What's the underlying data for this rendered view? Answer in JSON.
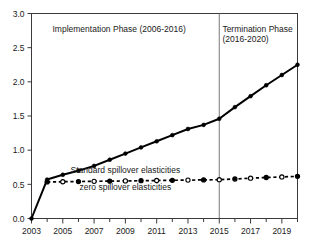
{
  "chart_data": {
    "type": "line",
    "title": "",
    "subtitle": "",
    "xlabel": "",
    "ylabel": "",
    "xlim": [
      2003,
      2020
    ],
    "ylim": [
      0.0,
      3.0
    ],
    "grid": false,
    "legend_position": "inline-annotation",
    "x": [
      2003,
      2004,
      2005,
      2006,
      2007,
      2008,
      2009,
      2010,
      2011,
      2012,
      2013,
      2014,
      2015,
      2016,
      2017,
      2018,
      2019,
      2020
    ],
    "y_ticks": [
      0.0,
      0.5,
      1.0,
      1.5,
      2.0,
      2.5,
      3.0
    ],
    "y_tick_labels": [
      "0.0",
      "0.5",
      "1.0",
      "1.5",
      "2.0",
      "2.5",
      "3.0"
    ],
    "x_ticks": [
      2003,
      2004,
      2005,
      2006,
      2007,
      2008,
      2009,
      2010,
      2011,
      2012,
      2013,
      2014,
      2015,
      2016,
      2017,
      2018,
      2019,
      2020
    ],
    "x_tick_labels": [
      "2003",
      "",
      "2005",
      "",
      "2007",
      "",
      "2009",
      "",
      "2011",
      "",
      "2013",
      "",
      "2015",
      "",
      "2017",
      "",
      "2019",
      ""
    ],
    "series": [
      {
        "name": "Standard spillover elasticities",
        "style": "solid",
        "marker": "filled-circle",
        "color": "#000000",
        "values": [
          0.0,
          0.57,
          0.64,
          0.7,
          0.77,
          0.86,
          0.95,
          1.04,
          1.13,
          1.22,
          1.31,
          1.37,
          1.46,
          1.63,
          1.79,
          1.95,
          2.1,
          2.25
        ]
      },
      {
        "name": "zero spillover elasticities",
        "style": "dashed",
        "marker": "alternating-open-filled-circle",
        "color": "#000000",
        "values": [
          null,
          0.535,
          0.538,
          0.541,
          0.544,
          0.547,
          0.55,
          0.553,
          0.556,
          0.559,
          0.562,
          0.565,
          0.568,
          0.578,
          0.59,
          0.6,
          0.608,
          0.617
        ]
      }
    ],
    "annotations": [
      {
        "name": "implementation-phase-label",
        "lines": [
          "Implementation Phase (2006-2016)"
        ],
        "x": 2008.6,
        "y": 2.73
      },
      {
        "name": "termination-phase-label",
        "lines": [
          "Termination Phase",
          "(2016-2020)"
        ],
        "x": 2015.2,
        "y": 2.73
      },
      {
        "name": "standard-spillover-series-label",
        "lines": [
          "Standard spillover elasticities"
        ],
        "x": 2009.0,
        "y": 0.66
      },
      {
        "name": "zero-spillover-series-label",
        "lines": [
          "zero spillover elasticities"
        ],
        "x": 2009.0,
        "y": 0.42
      }
    ],
    "divider": {
      "name": "phase-divider-line",
      "x": 2015,
      "label": "2015"
    }
  }
}
